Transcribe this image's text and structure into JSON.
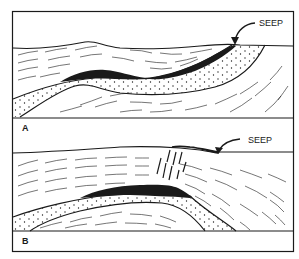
{
  "figure": {
    "panels": [
      {
        "id": "A",
        "letter": "A",
        "seep_label": "SEEP"
      },
      {
        "id": "B",
        "letter": "B",
        "seep_label": "SEEP"
      }
    ]
  },
  "colors": {
    "ink": "#1a1a1a",
    "paper": "#ffffff"
  }
}
